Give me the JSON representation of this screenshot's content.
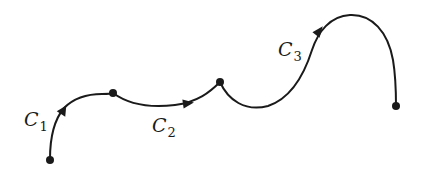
{
  "diagram": {
    "curves": [
      {
        "id": "C1",
        "label": "C",
        "subscript": "1",
        "direction": "start-to-junction-1"
      },
      {
        "id": "C2",
        "label": "C",
        "subscript": "2",
        "direction": "junction-1-to-junction-2"
      },
      {
        "id": "C3",
        "label": "C",
        "subscript": "3",
        "direction": "junction-2-to-end"
      }
    ],
    "points": [
      {
        "name": "start"
      },
      {
        "name": "junction-1"
      },
      {
        "name": "junction-2"
      },
      {
        "name": "end"
      }
    ],
    "colors": {
      "ink": "#1a1a1a",
      "background": "#ffffff"
    }
  }
}
